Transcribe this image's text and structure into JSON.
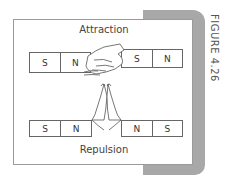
{
  "figure_label": "FIGURE 4.26",
  "attraction": {
    "title": "Attraction",
    "left_magnet": {
      "pole1": "S",
      "pole2": "N"
    },
    "right_magnet": {
      "pole1": "S",
      "pole2": "N"
    }
  },
  "repulsion": {
    "title": "Repulsion",
    "left_magnet": {
      "pole1": "S",
      "pole2": "N"
    },
    "right_magnet": {
      "pole1": "N",
      "pole2": "S"
    }
  },
  "colors": {
    "shadow": "#a8a8a8",
    "frame_border": "#9a9a9a",
    "line": "#666666"
  }
}
